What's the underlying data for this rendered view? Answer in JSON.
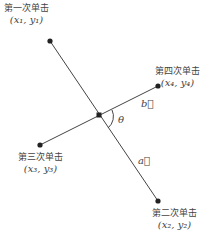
{
  "points": [
    {
      "id": 1,
      "label": "第一次单击",
      "coord": "(x₁, y₁)",
      "x": 50,
      "y": 41
    },
    {
      "id": 2,
      "label": "第二次单击",
      "coord": "(x₂, y₂)",
      "x": 158,
      "y": 201
    },
    {
      "id": 3,
      "label": "第三次单击",
      "coord": "(x₃, y₃)",
      "x": 40,
      "y": 145
    },
    {
      "id": 4,
      "label": "第四次单击",
      "coord": "(x₄, y₄)",
      "x": 158,
      "y": 86
    }
  ],
  "vectors": {
    "a": "a⃗",
    "b": "b⃗"
  },
  "angle": "θ",
  "intersection": {
    "x": 99,
    "y": 115
  }
}
